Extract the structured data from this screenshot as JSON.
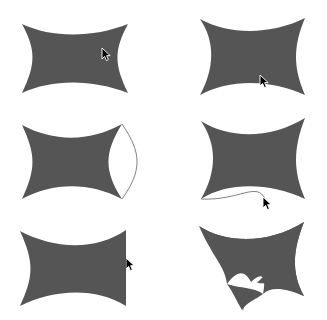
{
  "canvas": {
    "width": 327,
    "height": 320,
    "background_color": "#ffffff",
    "shape_fill_color": "#555555",
    "outline_color": "#4a4a4a",
    "cursor_color": "#000000",
    "cursor_outline_color": "#ffffff"
  },
  "grid": {
    "columns": 2,
    "rows": 3,
    "cell_width": 163,
    "cell_height": 107
  },
  "panels": [
    {
      "id": "panel-1",
      "name": "astroid-four-cusp-wide",
      "row": 1,
      "column": 1,
      "description": "Four-cusp astroid, concave sides, wide landscape orientation",
      "has_ghost_arc": false,
      "cursor": {
        "visible": true,
        "x": 104,
        "y": 54,
        "label": "drag-handle-right-cusp"
      }
    },
    {
      "id": "panel-2",
      "name": "astroid-right-side-bulged",
      "row": 1,
      "column": 2,
      "description": "Astroid with right side pulled outward into convex bulge",
      "has_ghost_arc": false,
      "cursor": {
        "visible": true,
        "x": 262,
        "y": 80,
        "label": "drag-handle-bottom-cusp"
      }
    },
    {
      "id": "panel-3",
      "name": "astroid-with-outlined-right-lobe",
      "row": 2,
      "column": 1,
      "description": "Astroid filled plus thin outlined convex arc bulging to the right",
      "has_ghost_arc": true,
      "ghost_arc_side": "right",
      "cursor": {
        "visible": true,
        "x": 128,
        "y": 157,
        "label": "drag-handle-right-arc"
      }
    },
    {
      "id": "panel-4",
      "name": "astroid-with-outlined-bottom-cusp",
      "row": 2,
      "column": 2,
      "description": "Astroid filled plus thin outlined arc dipping to a cusp point below center",
      "has_ghost_arc": true,
      "ghost_arc_side": "bottom",
      "cursor": {
        "visible": true,
        "x": 265,
        "y": 197,
        "label": "drag-handle-bottom-arc-tip"
      }
    },
    {
      "id": "panel-5",
      "name": "astroid-right-edge-flattened",
      "row": 3,
      "column": 1,
      "description": "Astroid with the right edge dragged out flat, forming a straight vertical side",
      "has_ghost_arc": false,
      "cursor": {
        "visible": true,
        "x": 128,
        "y": 263,
        "label": "drag-handle-right-edge"
      }
    },
    {
      "id": "panel-6",
      "name": "astroid-with-long-bottom-spike",
      "row": 3,
      "column": 2,
      "description": "Astroid with bottom cusp dragged far downward into a long narrow spike",
      "has_ghost_arc": false,
      "cursor": {
        "visible": true,
        "x": 282,
        "y": 281,
        "label": "drag-handle-spike-tip"
      }
    }
  ]
}
